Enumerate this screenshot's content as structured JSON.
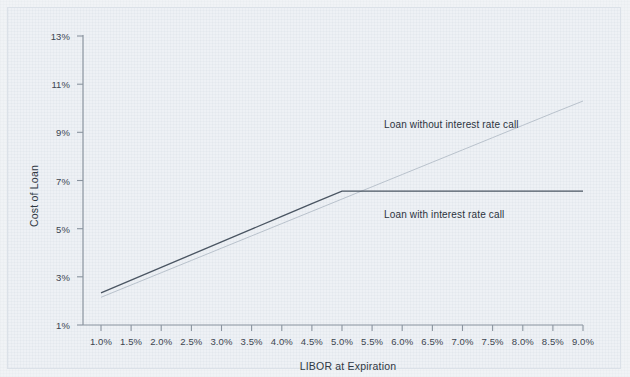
{
  "chart_data": {
    "type": "line",
    "title": "",
    "xlabel": "LIBOR at Expiration",
    "ylabel": "Cost of Loan",
    "xlim": [
      1.0,
      9.0
    ],
    "ylim": [
      1,
      13
    ],
    "grid": false,
    "legend_position": "inline-annotations",
    "x_tick_labels": [
      "1.0%",
      "1.5%",
      "2.0%",
      "2.5%",
      "3.0%",
      "3.5%",
      "4.0%",
      "4.5%",
      "5.0%",
      "5.5%",
      "6.0%",
      "6.5%",
      "7.0%",
      "7.5%",
      "8.0%",
      "8.5%",
      "9.0%"
    ],
    "x_tick_values": [
      1.0,
      1.5,
      2.0,
      2.5,
      3.0,
      3.5,
      4.0,
      4.5,
      5.0,
      5.5,
      6.0,
      6.5,
      7.0,
      7.5,
      8.0,
      8.5,
      9.0
    ],
    "y_tick_labels": [
      "1%",
      "3%",
      "5%",
      "7%",
      "9%",
      "11%",
      "13%"
    ],
    "y_tick_values": [
      1,
      3,
      5,
      7,
      9,
      11,
      13
    ],
    "x": [
      1.0,
      1.5,
      2.0,
      2.5,
      3.0,
      3.5,
      4.0,
      4.5,
      5.0,
      5.5,
      6.0,
      6.5,
      7.0,
      7.5,
      8.0,
      8.5,
      9.0
    ],
    "series": [
      {
        "name": "Loan without interest rate call",
        "color": "#b9c2cc",
        "width": 1.0,
        "values": [
          2.15,
          2.66,
          3.17,
          3.68,
          4.19,
          4.7,
          5.21,
          5.72,
          6.23,
          6.74,
          7.25,
          7.76,
          8.27,
          8.78,
          9.29,
          9.8,
          10.3
        ]
      },
      {
        "name": "Loan with interest rate call",
        "color": "#4a5562",
        "width": 1.3,
        "values": [
          2.33,
          2.86,
          3.39,
          3.92,
          4.45,
          4.98,
          5.51,
          6.04,
          6.56,
          6.56,
          6.56,
          6.56,
          6.56,
          6.56,
          6.56,
          6.56,
          6.56
        ]
      }
    ],
    "annotations": [
      {
        "id": "without",
        "text": "Loan without interest rate call"
      },
      {
        "id": "with",
        "text": "Loan with interest rate call"
      }
    ],
    "axis_color": "#8a949f",
    "text_color": "#2f3843",
    "background_color": "#eef1f5"
  }
}
